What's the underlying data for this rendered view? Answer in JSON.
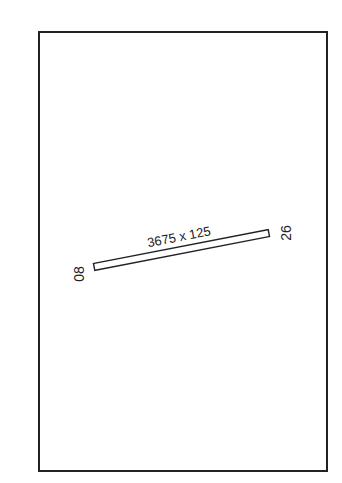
{
  "diagram": {
    "type": "airport-runway-diagram",
    "runway": {
      "dimensions_label": "3675 x 125",
      "end_left_label": "08",
      "end_right_label": "26"
    },
    "colors": {
      "line": "#222222",
      "background": "#ffffff"
    }
  }
}
